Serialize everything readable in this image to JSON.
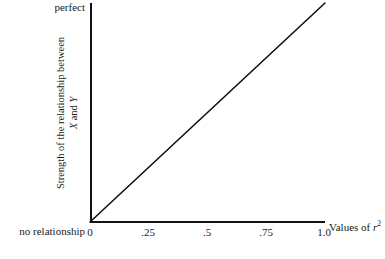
{
  "chart_data": {
    "type": "line",
    "title": "",
    "subtitle": "",
    "xlabel": "Values of r2",
    "xlabel_parts": {
      "prefix": "Values of ",
      "symbol": "r",
      "exponent": "2"
    },
    "ylabel_line1": "Strength of the relationship between",
    "ylabel_line2_prefix": "",
    "ylabel_x": "X",
    "ylabel_and": " and ",
    "ylabel_y": "Y",
    "x": [
      0,
      0.25,
      0.5,
      0.75,
      1.0
    ],
    "xticklabels": [
      "0",
      ".25",
      ".5",
      ".75",
      "1.0"
    ],
    "xlim": [
      0,
      1.0
    ],
    "ylim": [
      0,
      1.0
    ],
    "yticklabels": [],
    "y_axis_end_labels": {
      "top": "perfect",
      "bottom": "no relationship"
    },
    "series": [
      {
        "name": "strength of relationship",
        "x": [
          0,
          1.0
        ],
        "values": [
          0,
          1.0
        ]
      }
    ],
    "grid": false,
    "legend": false,
    "legend_position": "none",
    "annotations": [],
    "line_color": "#111111",
    "axis_color": "#111111",
    "background_color": "#ffffff"
  },
  "axis_geometry": {
    "origin_x": 90,
    "origin_y": 222,
    "x_end": 325,
    "y_end": 3,
    "tick_px": [
      90,
      148,
      207,
      266,
      324
    ]
  }
}
